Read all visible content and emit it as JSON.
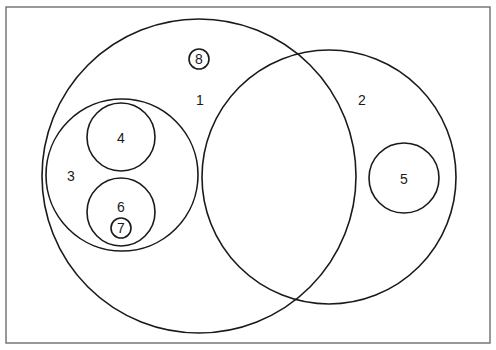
{
  "diagram": {
    "type": "nested-set-diagram",
    "frame": {
      "x": 6,
      "y": 7,
      "width": 484,
      "height": 336,
      "stroke": "#777777"
    },
    "sets": [
      {
        "id": "1",
        "label": "1",
        "cx": 199,
        "cy": 176,
        "r": 157,
        "label_x": 200,
        "label_y": 100,
        "circled_label": false
      },
      {
        "id": "2",
        "label": "2",
        "cx": 329,
        "cy": 177,
        "r": 127,
        "label_x": 362,
        "label_y": 100,
        "circled_label": false
      },
      {
        "id": "3",
        "label": "3",
        "cx": 122,
        "cy": 175,
        "r": 76,
        "label_x": 71,
        "label_y": 176,
        "circled_label": false
      },
      {
        "id": "4",
        "label": "4",
        "cx": 121,
        "cy": 137,
        "r": 34,
        "label_x": 121,
        "label_y": 138,
        "circled_label": false
      },
      {
        "id": "5",
        "label": "5",
        "cx": 404,
        "cy": 178,
        "r": 35,
        "label_x": 404,
        "label_y": 179,
        "circled_label": false
      },
      {
        "id": "6",
        "label": "6",
        "cx": 121,
        "cy": 212,
        "r": 34,
        "label_x": 121,
        "label_y": 207,
        "circled_label": false
      },
      {
        "id": "7",
        "label": "7",
        "cx": 121,
        "cy": 228,
        "r": 10,
        "label_x": 121,
        "label_y": 228,
        "circled_label": true
      },
      {
        "id": "8",
        "label": "8",
        "cx": 199,
        "cy": 59,
        "r": 10,
        "label_x": 199,
        "label_y": 59,
        "circled_label": true
      }
    ],
    "colors": {
      "stroke": "#1a1a1a",
      "background": "#ffffff"
    }
  }
}
